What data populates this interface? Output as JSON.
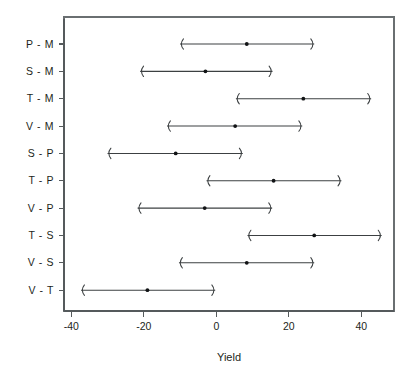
{
  "chart_data": {
    "type": "scatter",
    "title": "",
    "subtitle": "",
    "xlabel": "Yield",
    "ylabel": "",
    "xlim": [
      -42,
      49
    ],
    "xticks": [
      -40,
      -20,
      0,
      20,
      40
    ],
    "xticklabels": [
      "-40",
      "-20",
      "0",
      "20",
      "40"
    ],
    "grid": false,
    "legend": null,
    "orientation": "horizontal",
    "categories": [
      "P - M",
      "S - M",
      "T - M",
      "V - M",
      "S - P",
      "T - P",
      "V - P",
      "T - S",
      "V - S",
      "V - T"
    ],
    "series": [
      {
        "name": "difference in mean yield",
        "values": [
          8.4,
          -3.0,
          24.0,
          5.2,
          -11.2,
          15.8,
          -3.2,
          27.0,
          8.4,
          -19.0
        ]
      },
      {
        "name": "lower confidence limit",
        "values": [
          -10.0,
          -21.0,
          5.4,
          -13.6,
          -30.0,
          -2.7,
          -21.7,
          8.6,
          -10.3,
          -37.3
        ]
      },
      {
        "name": "upper confidence limit",
        "values": [
          27.0,
          15.5,
          42.7,
          23.7,
          7.3,
          34.5,
          15.4,
          45.6,
          27.0,
          -0.3
        ]
      }
    ],
    "points": [
      {
        "label": "P - M",
        "estimate": 8.4,
        "lower": -10.0,
        "upper": 27.0
      },
      {
        "label": "S - M",
        "estimate": -3.0,
        "lower": -21.0,
        "upper": 15.5
      },
      {
        "label": "T - M",
        "estimate": 24.0,
        "lower": 5.4,
        "upper": 42.7
      },
      {
        "label": "V - M",
        "estimate": 5.2,
        "lower": -13.6,
        "upper": 23.7
      },
      {
        "label": "S - P",
        "estimate": -11.2,
        "lower": -30.0,
        "upper": 7.3
      },
      {
        "label": "T - P",
        "estimate": 15.8,
        "lower": -2.7,
        "upper": 34.5
      },
      {
        "label": "V - P",
        "estimate": -3.2,
        "lower": -21.7,
        "upper": 15.4
      },
      {
        "label": "T - S",
        "estimate": 27.0,
        "lower": 8.6,
        "upper": 45.6
      },
      {
        "label": "V - S",
        "estimate": 8.4,
        "lower": -10.3,
        "upper": 27.0
      },
      {
        "label": "V - T",
        "estimate": -19.0,
        "lower": -37.3,
        "upper": -0.3
      }
    ],
    "colors": {
      "line": "#3c4042",
      "point": "#111315",
      "axis": "#555a5c",
      "border": "#6a6f71",
      "background": "#ffffff"
    }
  }
}
